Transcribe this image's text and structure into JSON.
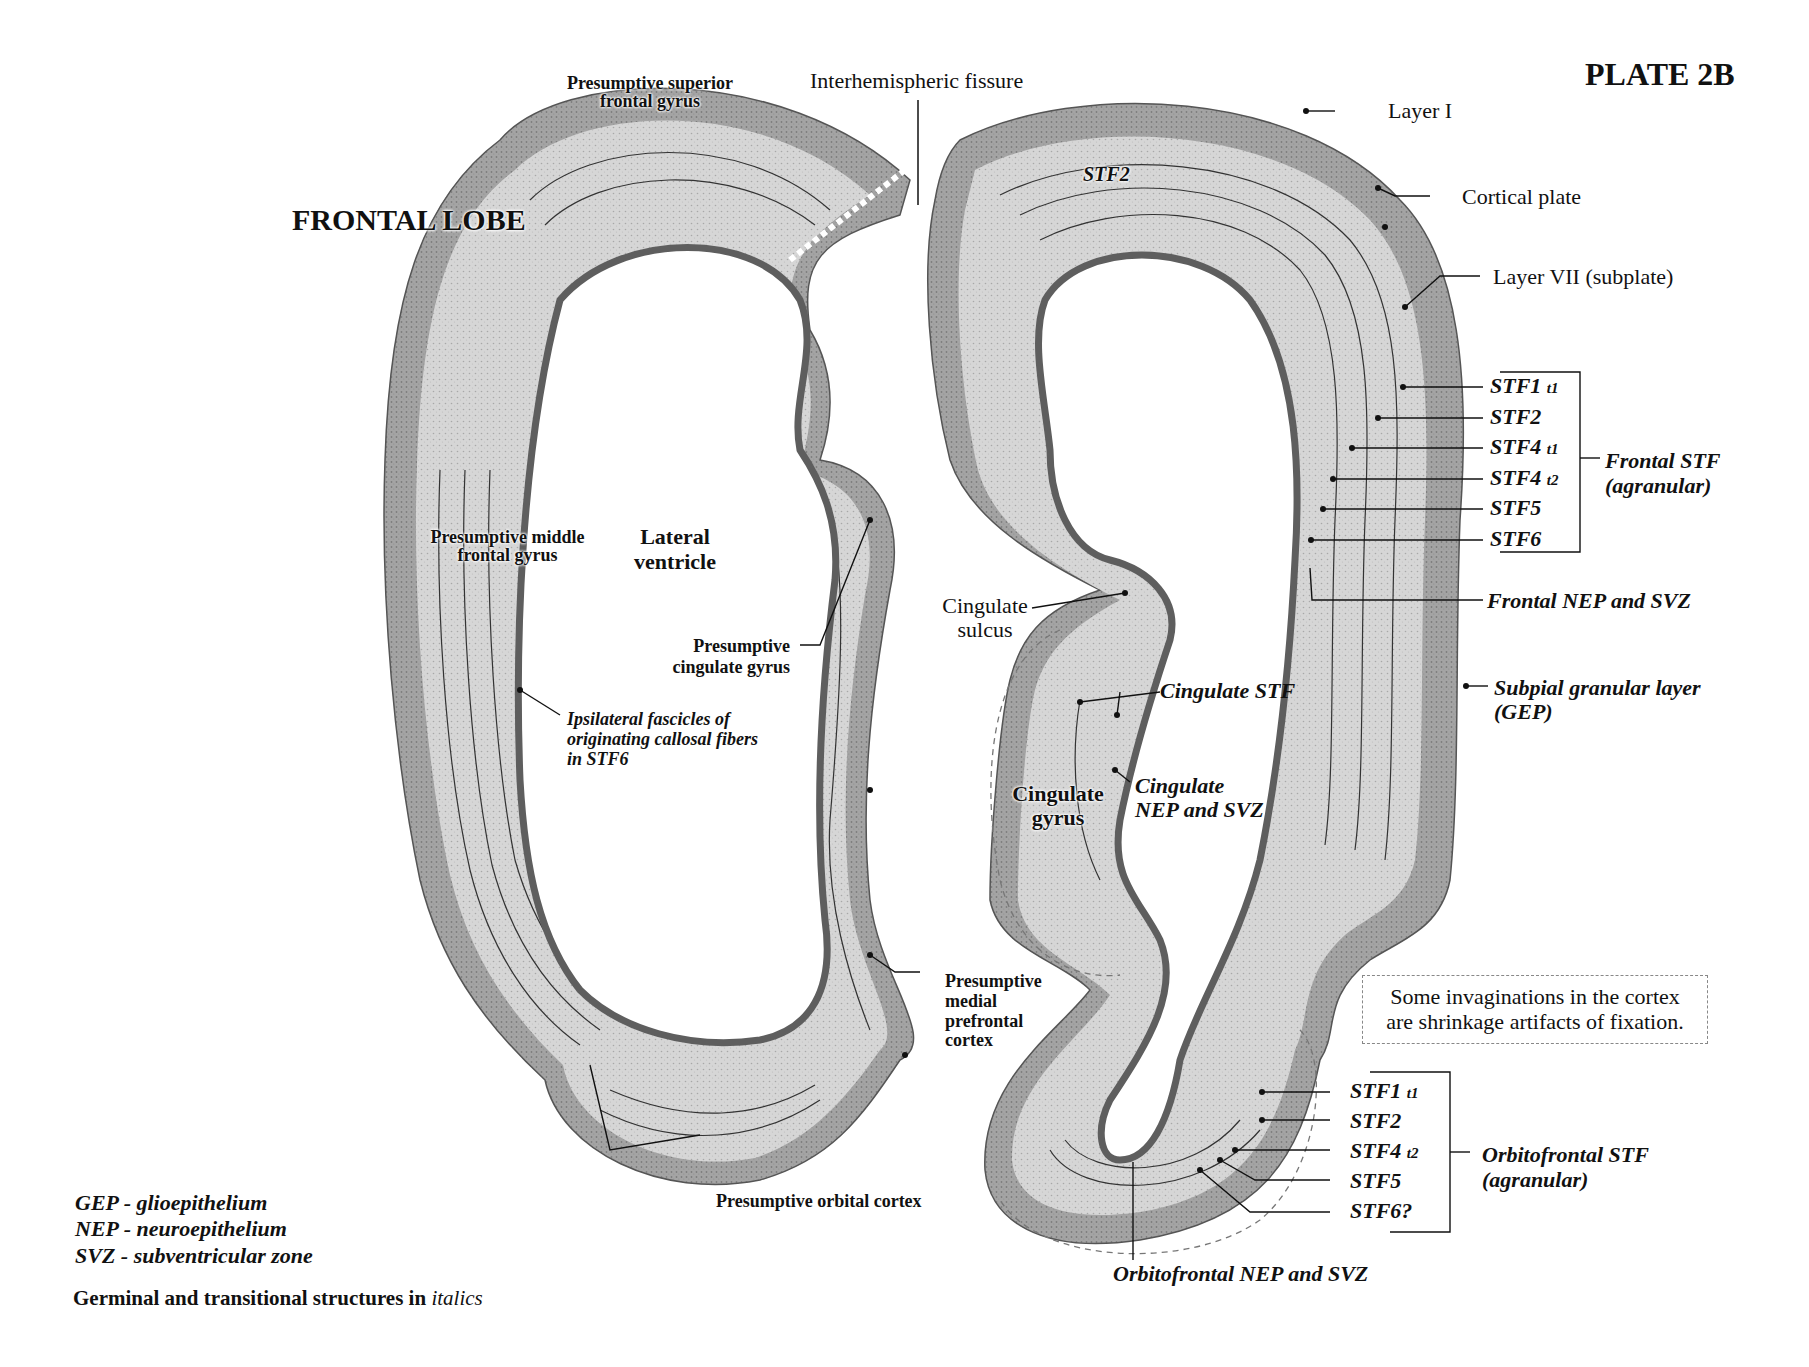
{
  "plate_title": "PLATE 2B",
  "lobe_title": "FRONTAL LOBE",
  "colors": {
    "background": "#ffffff",
    "tissue_outer": "#a9a9a9",
    "tissue_mid": "#d2d2d2",
    "tissue_light": "#e9e9e9",
    "neuroepithelium": "#6e6e6e",
    "ink": "#111111"
  },
  "left_section": {
    "labels": {
      "superior_gyrus": "Presumptive superior\nfrontal gyrus",
      "superior_gyrus_line1": "Presumptive superior",
      "superior_gyrus_line2": "frontal gyrus",
      "middle_gyrus_line1": "Presumptive middle",
      "middle_gyrus_line2": "frontal gyrus",
      "lateral_ventricle_line1": "Lateral",
      "lateral_ventricle_line2": "ventricle",
      "ipsilateral_line1": "Ipsilateral fascicles of",
      "ipsilateral_line2": "originating callosal fibers",
      "ipsilateral_line3": "in STF6",
      "cingulate_gyrus_line1": "Presumptive",
      "cingulate_gyrus_line2": "cingulate gyrus",
      "medial_prefrontal_line1": "Presumptive",
      "medial_prefrontal_line2": "medial",
      "medial_prefrontal_line3": "prefrontal",
      "medial_prefrontal_line4": "cortex",
      "orbital_cortex": "Presumptive orbital cortex"
    }
  },
  "center_labels": {
    "interhemispheric_fissure": "Interhemispheric fissure",
    "cingulate_sulcus_line1": "Cingulate",
    "cingulate_sulcus_line2": "sulcus"
  },
  "right_section": {
    "labels": {
      "stf2_inner": "STF2",
      "layer_i": "Layer I",
      "cortical_plate": "Cortical plate",
      "layer_vii": "Layer VII (subplate)",
      "cingulate_stf": "Cingulate STF",
      "cingulate_nep_line1": "Cingulate",
      "cingulate_nep_line2": "NEP and SVZ",
      "cingulate_gyrus_line1": "Cingulate",
      "cingulate_gyrus_line2": "gyrus",
      "frontal_nep_svz": "Frontal NEP and SVZ",
      "subpial_line1": "Subpial granular layer",
      "subpial_line2": "(GEP)",
      "orbitofrontal_nep_svz": "Orbitofrontal  NEP and SVZ"
    },
    "frontal_stf_group": {
      "title_line1": "Frontal STF",
      "title_line2": "(agranular)",
      "items": [
        {
          "name": "STF1",
          "sub": "t1"
        },
        {
          "name": "STF2",
          "sub": ""
        },
        {
          "name": "STF4",
          "sub": "t1"
        },
        {
          "name": "STF4",
          "sub": "t2"
        },
        {
          "name": "STF5",
          "sub": ""
        },
        {
          "name": "STF6",
          "sub": ""
        }
      ]
    },
    "orbitofrontal_stf_group": {
      "title_line1": "Orbitofrontal STF",
      "title_line2": "(agranular)",
      "items": [
        {
          "name": "STF1",
          "sub": "t1"
        },
        {
          "name": "STF2",
          "sub": ""
        },
        {
          "name": "STF4",
          "sub": "t2"
        },
        {
          "name": "STF5",
          "sub": ""
        },
        {
          "name": "STF6?",
          "sub": ""
        }
      ]
    }
  },
  "note": {
    "line1": "Some invaginations in the cortex",
    "line2": "are shrinkage artifacts of fixation."
  },
  "legend": {
    "items": [
      "GEP - glioepithelium",
      "NEP - neuroepithelium",
      "SVZ - subventricular zone"
    ],
    "footer_main": "Germinal and transitional structures in ",
    "footer_italic": "italics"
  }
}
